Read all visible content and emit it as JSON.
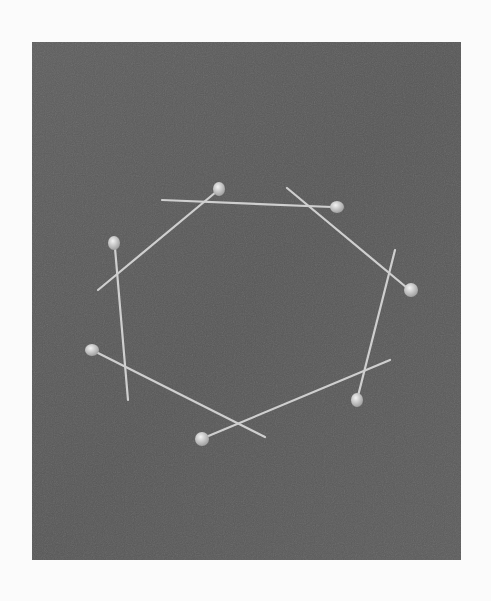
{
  "image": {
    "description": "Black and white photograph of seven straight pins with round heads arranged in a closed polygon ring on a dark textured surface",
    "pin_count": 7,
    "colors": {
      "page_background": "#fbfbfb",
      "surface": "#5a5a5a",
      "pin": "#c8c8c8",
      "pin_head": "#e0e0e0"
    }
  }
}
